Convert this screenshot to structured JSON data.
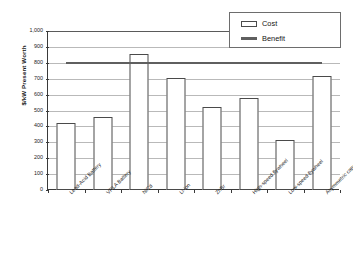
{
  "chart_data": {
    "type": "bar",
    "title": "",
    "xlabel": "",
    "ylabel": "$/kW Present Worth",
    "ylim": [
      0,
      1000
    ],
    "ytick_labels": [
      "1,000",
      "900",
      "800",
      "700",
      "600",
      "500",
      "400",
      "300",
      "200",
      "100",
      "0"
    ],
    "ytick_values": [
      1000,
      900,
      800,
      700,
      600,
      500,
      400,
      300,
      200,
      100,
      0
    ],
    "grid": true,
    "legend_position": "top-right",
    "categories": [
      "Lead-Acid Battery",
      "VRLA Battery",
      "NiCd",
      "Li-ion",
      "ZnBr",
      "High-speed flywheel",
      "Low-speed flywheel",
      "Asymmetric capacitor"
    ],
    "series": [
      {
        "name": "Cost",
        "type": "bar",
        "values": [
          420,
          460,
          855,
          705,
          520,
          580,
          315,
          720
        ]
      },
      {
        "name": "Benefit",
        "type": "line",
        "constant_value": 800,
        "values": [
          800,
          800,
          800,
          800,
          800,
          800,
          800,
          800
        ]
      }
    ]
  },
  "legend": {
    "items": [
      {
        "label": "Cost",
        "swatch": "rect-outline",
        "color": "#ffffff",
        "border": "#4a4a4a"
      },
      {
        "label": "Benefit",
        "swatch": "line",
        "color": "#5f5f5f"
      }
    ]
  },
  "colors": {
    "bar_fill": "#ffffff",
    "bar_border": "#4a4a4a",
    "benefit_line": "#5f5f5f",
    "gridline": "#b9b9b9",
    "axis": "#3a3a3a",
    "text": "#1c1c1c",
    "background": "#ffffff"
  }
}
